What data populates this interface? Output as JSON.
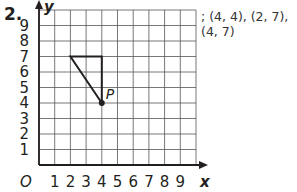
{
  "problem": {
    "number": "2.",
    "answer_text": "; (4, 4), (2, 7), (4, 7)"
  },
  "graph": {
    "x_axis_label": "x",
    "y_axis_label": "y",
    "origin_label": "O",
    "x_ticks": [
      "1",
      "2",
      "3",
      "4",
      "5",
      "6",
      "7",
      "8",
      "9"
    ],
    "y_ticks": [
      "1",
      "2",
      "3",
      "4",
      "5",
      "6",
      "7",
      "8",
      "9"
    ],
    "point_label": "P",
    "point": [
      4,
      4
    ],
    "triangle_vertices": [
      [
        4,
        4
      ],
      [
        2,
        7
      ],
      [
        4,
        7
      ]
    ]
  },
  "chart_data": {
    "type": "scatter",
    "title": "",
    "xlabel": "x",
    "ylabel": "y",
    "xlim": [
      0,
      10
    ],
    "ylim": [
      0,
      10
    ],
    "grid": true,
    "points": [
      {
        "label": "P",
        "x": 4,
        "y": 4
      }
    ],
    "polygon": [
      [
        4,
        4
      ],
      [
        2,
        7
      ],
      [
        4,
        7
      ]
    ],
    "annotations": [
      "; (4, 4), (2, 7), (4, 7)"
    ]
  }
}
